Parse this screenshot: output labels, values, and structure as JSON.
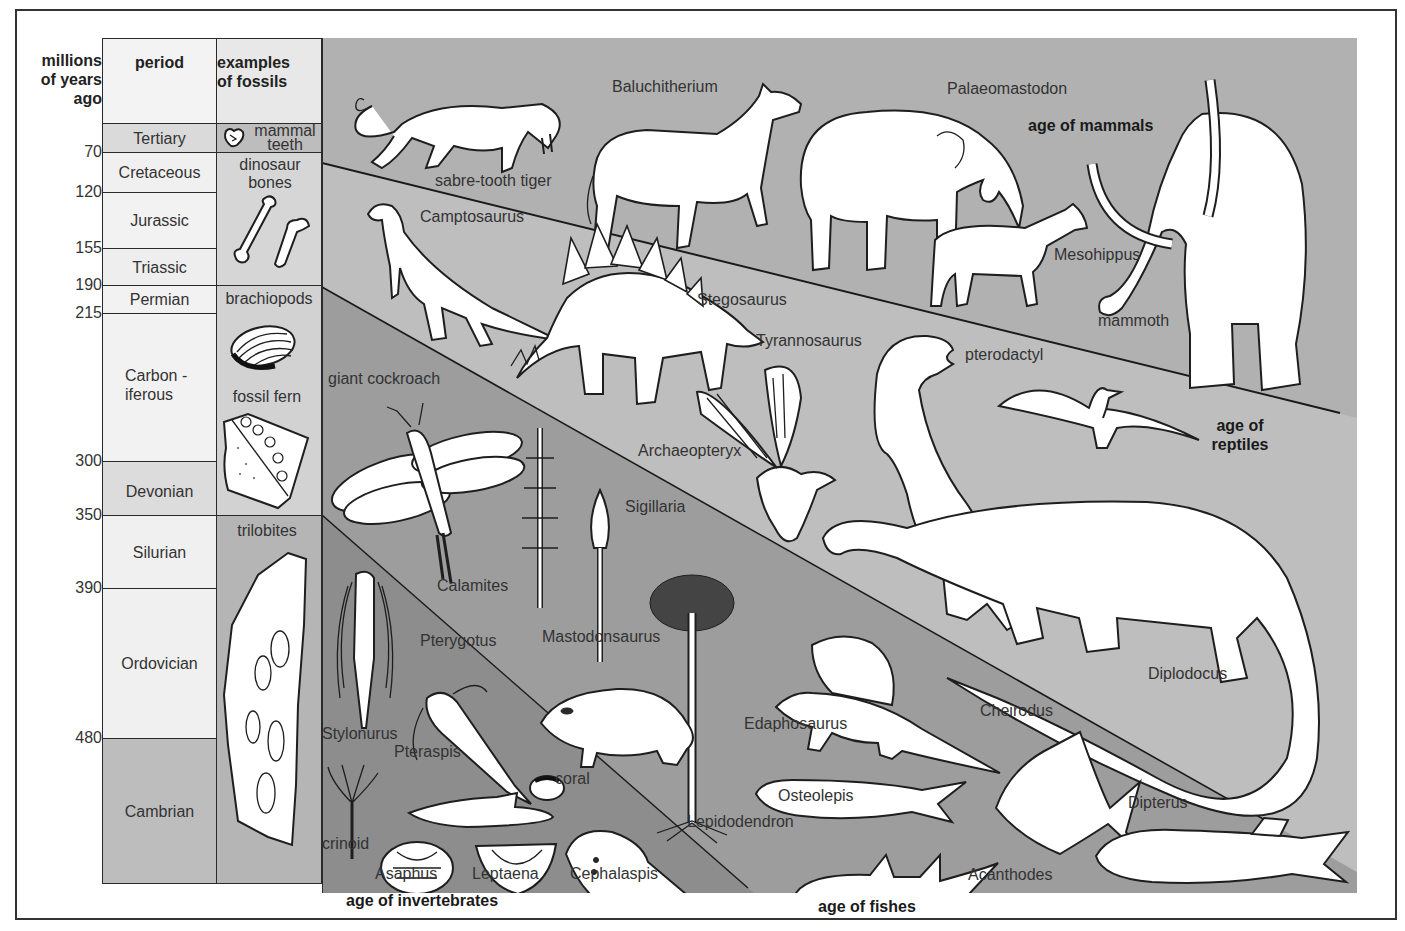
{
  "timeline": {
    "header_mya": "millions of years ago",
    "header_mya_lines": [
      "millions",
      "of years",
      "ago"
    ],
    "header_period": "period",
    "header_fossils_lines": [
      "examples",
      "of fossils"
    ],
    "mya_ticks": [
      {
        "value": "70",
        "y": 143
      },
      {
        "value": "120",
        "y": 183
      },
      {
        "value": "155",
        "y": 239
      },
      {
        "value": "190",
        "y": 276
      },
      {
        "value": "215",
        "y": 304
      },
      {
        "value": "300",
        "y": 452
      },
      {
        "value": "350",
        "y": 506
      },
      {
        "value": "390",
        "y": 579
      },
      {
        "value": "480",
        "y": 729
      }
    ],
    "periods": [
      {
        "name": "Tertiary",
        "top": 123,
        "bottom": 152,
        "color": "#dadada"
      },
      {
        "name": "Cretaceous",
        "top": 152,
        "bottom": 192,
        "color": "#f0f0f0"
      },
      {
        "name": "Jurassic",
        "top": 192,
        "bottom": 248,
        "color": "#f2f2f2"
      },
      {
        "name": "Triassic",
        "top": 248,
        "bottom": 285,
        "color": "#eeeeee"
      },
      {
        "name": "Permian",
        "top": 285,
        "bottom": 313,
        "color": "#f2f2f2"
      },
      {
        "name": "Carbon - iferous",
        "lines": [
          "Carbon -",
          "iferous"
        ],
        "top": 313,
        "bottom": 461,
        "color": "#f2f2f2"
      },
      {
        "name": "Devonian",
        "top": 461,
        "bottom": 515,
        "color": "#dcdcdc"
      },
      {
        "name": "Silurian",
        "top": 515,
        "bottom": 588,
        "color": "#f0f0f0"
      },
      {
        "name": "Ordovician",
        "top": 588,
        "bottom": 738,
        "color": "#f0f0f0"
      },
      {
        "name": "Cambrian",
        "top": 738,
        "bottom": 883,
        "color": "#bdbdbd"
      }
    ],
    "fossils": [
      {
        "label": "mammal teeth",
        "lines": [
          "mammal",
          "teeth"
        ],
        "top": 123,
        "bottom": 152,
        "color": "#bdbdbd",
        "icon": "tooth-icon"
      },
      {
        "label": "dinosaur bones",
        "lines": [
          "dinosaur",
          "bones"
        ],
        "top": 152,
        "bottom": 285,
        "color": "#d6d6d6",
        "icon": "bone-icon"
      },
      {
        "label": "brachiopods",
        "lines": [
          "brachiopods"
        ],
        "top": 285,
        "bottom": 515,
        "color": "#d2d2d2",
        "icon": "brachiopod-shell-icon"
      },
      {
        "label": "fossil fern",
        "lines": [
          "fossil fern"
        ],
        "icon": "fossil-fern-icon"
      },
      {
        "label": "trilobites",
        "lines": [
          "trilobites"
        ],
        "top": 515,
        "bottom": 883,
        "color": "#b5b5b5",
        "icon": "trilobite-slab-icon"
      }
    ]
  },
  "bands": {
    "colors": {
      "mammals": "#b1b1b1",
      "reptiles": "#bebebe",
      "amphibians_fishes": "#9d9d9d",
      "invertebrates": "#8d8d8d"
    }
  },
  "ages": {
    "mammals": "age of mammals",
    "reptiles_lines": [
      "age of",
      "reptiles"
    ],
    "invertebrates": "age of invertebrates",
    "fishes": "age of fishes"
  },
  "organisms": {
    "mammals": [
      "sabre-tooth tiger",
      "Baluchitherium",
      "Palaeomastodon",
      "Mesohippus",
      "mammoth"
    ],
    "reptiles": [
      "Camptosaurus",
      "Stegosaurus",
      "Tyrannosaurus",
      "pterodactyl",
      "Archaeopteryx",
      "Diplodocus"
    ],
    "amphibians_plants": [
      "giant cockroach",
      "Calamites",
      "Sigillaria",
      "Mastodonsaurus",
      "Lepidodendron",
      "Edaphosaurus"
    ],
    "fishes": [
      "Cheirodus",
      "Osteolepis",
      "Dipterus",
      "Acanthodes"
    ],
    "invertebrates": [
      "Stylonurus",
      "Pterygotus",
      "Pteraspis",
      "coral",
      "crinoid",
      "Asaphus",
      "Leptaena",
      "Cephalaspis"
    ]
  }
}
